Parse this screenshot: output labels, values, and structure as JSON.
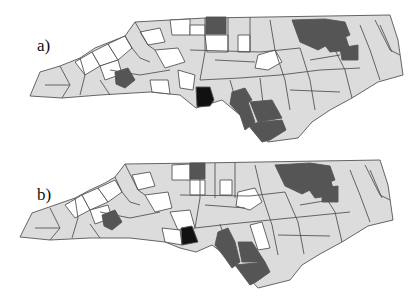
{
  "figure": {
    "panels": [
      {
        "id": "a",
        "label": "a)"
      },
      {
        "id": "b",
        "label": "b)"
      }
    ],
    "region": "North Carolina counties",
    "shading_colors": {
      "white": "#ffffff",
      "light": "#dcdcdc",
      "dark": "#555555",
      "black": "#111111",
      "border": "#555555"
    }
  }
}
